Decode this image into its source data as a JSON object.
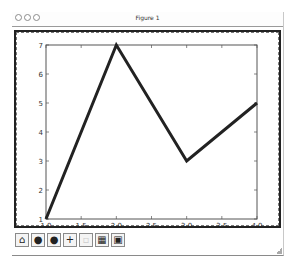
{
  "window": {
    "title": "Figure 1",
    "traffic_lights": [
      "close",
      "minimize",
      "zoom"
    ]
  },
  "toolbar": {
    "buttons": [
      {
        "name": "home",
        "icon": "home-icon",
        "glyph": "⌂",
        "enabled": true
      },
      {
        "name": "back",
        "icon": "back-icon",
        "glyph": "●",
        "enabled": true
      },
      {
        "name": "forward",
        "icon": "forward-icon",
        "glyph": "●",
        "enabled": true
      },
      {
        "name": "pan",
        "icon": "pan-icon",
        "glyph": "+",
        "enabled": true
      },
      {
        "name": "zoom",
        "icon": "zoom-icon",
        "glyph": "▫",
        "enabled": false
      },
      {
        "name": "configure-subplots",
        "icon": "subplots-icon",
        "glyph": "▦",
        "enabled": true
      },
      {
        "name": "save",
        "icon": "save-icon",
        "glyph": "▣",
        "enabled": true
      }
    ]
  },
  "colors": {
    "line": "#222222",
    "axes": "#555555",
    "frame": "#222222"
  },
  "chart_data": {
    "type": "line",
    "title": "",
    "xlabel": "",
    "ylabel": "",
    "x": [
      1.0,
      2.0,
      3.0,
      4.0
    ],
    "series": [
      {
        "name": "line",
        "values": [
          1,
          7,
          3,
          5
        ]
      }
    ],
    "xlim": [
      1.0,
      4.0
    ],
    "ylim": [
      1,
      7
    ],
    "xticks": [
      "1.0",
      "1.5",
      "2.0",
      "2.5",
      "3.0",
      "3.5",
      "4.0"
    ],
    "yticks": [
      "1",
      "2",
      "3",
      "4",
      "5",
      "6",
      "7"
    ],
    "grid": false,
    "legend": null
  }
}
